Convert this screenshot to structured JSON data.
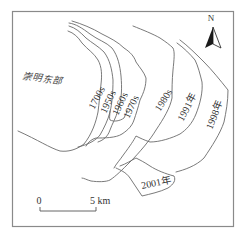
{
  "map": {
    "place_label": "崇明东部",
    "shorelines": [
      {
        "label": "1700s"
      },
      {
        "label": "1950s"
      },
      {
        "label": "1960s"
      },
      {
        "label": "1970s"
      },
      {
        "label": "1980s"
      },
      {
        "label": "1991年"
      },
      {
        "label": "1998年"
      },
      {
        "label": "2001年"
      }
    ],
    "north_arrow": {
      "label": "N"
    },
    "scale_bar": {
      "start_label": "0",
      "end_label": "5 km"
    },
    "colors": {
      "line": "#6b6b6b",
      "frame": "#8a8a8a",
      "arrow_dark": "#1a1a1a",
      "background": "#ffffff"
    }
  }
}
